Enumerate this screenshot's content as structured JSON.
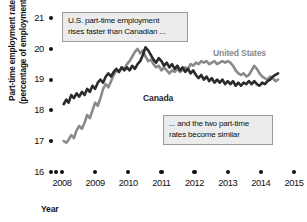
{
  "chart_data": {
    "type": "line",
    "title": "",
    "xlabel": "Year",
    "ylabel": "Part-time employment rate (percentage of employment)",
    "ylabel_line1": "Part-time employment rate",
    "ylabel_line2": "(percentage of employment)",
    "xlim": [
      2008.0,
      2015.0
    ],
    "ylim": [
      16,
      21
    ],
    "ytick_labels": [
      "21",
      "20",
      "19",
      "18",
      "17",
      "16"
    ],
    "ytick_values": [
      21,
      20,
      19,
      18,
      17,
      16
    ],
    "xtick_labels": [
      "2008",
      "2009",
      "2010",
      "2011",
      "2012",
      "2013",
      "2014",
      "2015"
    ],
    "xtick_values": [
      2008,
      2009,
      2010,
      2011,
      2012,
      2013,
      2014,
      2015
    ],
    "grid": false,
    "legend_position": "inline-labels",
    "colors": {
      "canada": "#2b2b2b",
      "united_states": "#8a8a8a",
      "axis_text": "#111111",
      "callout_fill": "#ececec",
      "callout_border": "#9a9a9a"
    },
    "annotations": [
      {
        "name": "callout-top",
        "line1": "U.S. part-time employment",
        "line2": "rises faster than Canadian ..."
      },
      {
        "name": "callout-bottom",
        "line1": "... and the two part-time",
        "line2": "rates become similar"
      }
    ],
    "series": [
      {
        "name": "United States",
        "label": "United States",
        "color": "#8a8a8a",
        "x": [
          2008.05,
          2008.13,
          2008.2,
          2008.28,
          2008.36,
          2008.44,
          2008.52,
          2008.6,
          2008.68,
          2008.76,
          2008.84,
          2008.92,
          2009.0,
          2009.08,
          2009.16,
          2009.24,
          2009.32,
          2009.4,
          2009.48,
          2009.56,
          2009.64,
          2009.72,
          2009.8,
          2009.88,
          2009.96,
          2010.04,
          2010.12,
          2010.2,
          2010.28,
          2010.36,
          2010.44,
          2010.52,
          2010.6,
          2010.68,
          2010.76,
          2010.84,
          2010.92,
          2011.0,
          2011.08,
          2011.16,
          2011.24,
          2011.32,
          2011.4,
          2011.48,
          2011.56,
          2011.64,
          2011.72,
          2011.8,
          2011.88,
          2011.96,
          2012.04,
          2012.12,
          2012.2,
          2012.28,
          2012.36,
          2012.44,
          2012.52,
          2012.6,
          2012.68,
          2012.76,
          2012.84,
          2012.92,
          2013.0,
          2013.08,
          2013.16,
          2013.24,
          2013.32,
          2013.4,
          2013.48,
          2013.56,
          2013.64,
          2013.72,
          2013.8,
          2013.88,
          2013.96,
          2014.04,
          2014.12,
          2014.2,
          2014.28,
          2014.36,
          2014.44,
          2014.52
        ],
        "y": [
          17.0,
          16.95,
          17.05,
          17.2,
          17.1,
          17.35,
          17.5,
          17.4,
          17.6,
          17.85,
          17.75,
          18.0,
          18.25,
          18.15,
          18.4,
          18.7,
          18.85,
          18.75,
          18.95,
          19.15,
          19.3,
          19.25,
          19.4,
          19.35,
          19.5,
          19.6,
          19.75,
          19.9,
          20.0,
          19.85,
          19.95,
          19.75,
          19.6,
          19.65,
          19.5,
          19.4,
          19.45,
          19.3,
          19.4,
          19.3,
          19.2,
          19.3,
          19.25,
          19.35,
          19.25,
          19.3,
          19.4,
          19.35,
          19.5,
          19.45,
          19.55,
          19.5,
          19.6,
          19.55,
          19.6,
          19.5,
          19.55,
          19.6,
          19.5,
          19.55,
          19.6,
          19.55,
          19.6,
          19.55,
          19.45,
          19.3,
          19.2,
          19.15,
          19.2,
          19.1,
          19.15,
          19.3,
          19.45,
          19.35,
          19.2,
          19.1,
          19.05,
          19.0,
          19.1,
          19.05,
          18.95,
          19.0
        ],
        "notes": "Starts ~17.0 at 2008, rises steeply through 2008-2009, peaks ~20.0 in early 2010, plateaus ~19.5, dips ~19.1 in 2013, converges with Canada ~19.0 by mid-2014."
      },
      {
        "name": "Canada",
        "label": "Canada",
        "color": "#2b2b2b",
        "x": [
          2008.05,
          2008.13,
          2008.2,
          2008.28,
          2008.36,
          2008.44,
          2008.52,
          2008.6,
          2008.68,
          2008.76,
          2008.84,
          2008.92,
          2009.0,
          2009.08,
          2009.16,
          2009.24,
          2009.32,
          2009.4,
          2009.48,
          2009.56,
          2009.64,
          2009.72,
          2009.8,
          2009.88,
          2009.96,
          2010.04,
          2010.12,
          2010.2,
          2010.28,
          2010.36,
          2010.44,
          2010.52,
          2010.6,
          2010.68,
          2010.76,
          2010.84,
          2010.92,
          2011.0,
          2011.08,
          2011.16,
          2011.24,
          2011.32,
          2011.4,
          2011.48,
          2011.56,
          2011.64,
          2011.72,
          2011.8,
          2011.88,
          2011.96,
          2012.04,
          2012.12,
          2012.2,
          2012.28,
          2012.36,
          2012.44,
          2012.52,
          2012.6,
          2012.68,
          2012.76,
          2012.84,
          2012.92,
          2013.0,
          2013.08,
          2013.16,
          2013.24,
          2013.32,
          2013.4,
          2013.48,
          2013.56,
          2013.64,
          2013.72,
          2013.8,
          2013.88,
          2013.96,
          2014.04,
          2014.12,
          2014.2,
          2014.28,
          2014.36,
          2014.44,
          2014.52
        ],
        "y": [
          18.2,
          18.35,
          18.25,
          18.5,
          18.4,
          18.55,
          18.45,
          18.6,
          18.5,
          18.7,
          18.6,
          18.8,
          18.7,
          18.9,
          19.0,
          18.9,
          19.1,
          19.2,
          19.1,
          19.25,
          19.35,
          19.25,
          19.4,
          19.3,
          19.4,
          19.3,
          19.45,
          19.35,
          19.5,
          19.6,
          19.8,
          20.05,
          19.95,
          19.8,
          19.65,
          19.55,
          19.7,
          19.6,
          19.45,
          19.55,
          19.4,
          19.5,
          19.35,
          19.45,
          19.3,
          19.4,
          19.25,
          19.35,
          19.2,
          19.3,
          19.15,
          19.05,
          19.15,
          19.0,
          19.1,
          18.95,
          19.05,
          18.9,
          19.0,
          18.9,
          19.0,
          18.85,
          18.95,
          18.85,
          18.95,
          18.8,
          18.9,
          18.8,
          18.9,
          18.85,
          18.95,
          18.85,
          18.95,
          18.85,
          18.8,
          18.9,
          18.85,
          18.95,
          19.0,
          19.1,
          19.15,
          19.2
        ],
        "notes": "Starts ~18.2 in early 2008, noisy climb to ~19.3 by late 2009, peaks ~20.1 mid-2010, gradual decline to ~18.8-19.0 through 2012-2014, ends ~19.2."
      }
    ]
  }
}
